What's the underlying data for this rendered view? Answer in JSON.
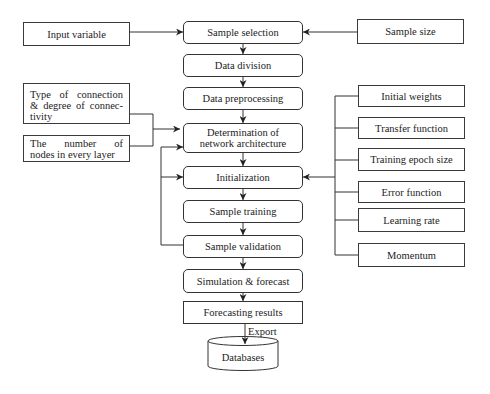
{
  "diagram": {
    "main_flow": [
      {
        "label": "Sample selection"
      },
      {
        "label": "Data division"
      },
      {
        "label": "Data preprocessing"
      },
      {
        "lines": [
          "Determination of",
          "network architecture"
        ]
      },
      {
        "label": "Initialization"
      },
      {
        "label": "Sample training"
      },
      {
        "label": "Sample validation"
      },
      {
        "label": "Simulation & forecast"
      },
      {
        "label": "Forecasting results"
      }
    ],
    "left_inputs": [
      {
        "label": "Input variable"
      },
      {
        "lines": [
          "Type of connection",
          "& degree of connec-",
          "tivity"
        ]
      },
      {
        "lines": [
          "The number of",
          "nodes in every layer"
        ]
      }
    ],
    "right_inputs": {
      "sample_size": "Sample size"
    },
    "training_parameters": [
      "Initial weights",
      "Transfer function",
      "Training epoch size",
      "Error function",
      "Learning rate",
      "Momentum"
    ],
    "export_label": "Export",
    "output_store": {
      "label": "Databases",
      "shape": "cylinder"
    },
    "edges": [
      {
        "from": "Input variable",
        "to": "Sample selection"
      },
      {
        "from": "Sample size",
        "to": "Sample selection"
      },
      {
        "from": "Sample selection",
        "to": "Data division"
      },
      {
        "from": "Data division",
        "to": "Data preprocessing"
      },
      {
        "from": "Data preprocessing",
        "to": "Determination of network architecture"
      },
      {
        "from": "Type of connection & degree of connectivity",
        "to": "Determination of network architecture"
      },
      {
        "from": "The number of nodes in every layer",
        "to": "Determination of network architecture"
      },
      {
        "from": "Determination of network architecture",
        "to": "Initialization"
      },
      {
        "from": "Training parameters",
        "to": "Initialization"
      },
      {
        "from": "Initialization",
        "to": "Sample training"
      },
      {
        "from": "Sample training",
        "to": "Sample validation"
      },
      {
        "from": "Sample validation",
        "to": "Determination of network architecture"
      },
      {
        "from": "Sample validation",
        "to": "Initialization"
      },
      {
        "from": "Sample validation",
        "to": "Simulation & forecast"
      },
      {
        "from": "Simulation & forecast",
        "to": "Forecasting results"
      },
      {
        "from": "Forecasting results",
        "to": "Databases",
        "label": "Export"
      }
    ],
    "colors": {
      "line": "#333333",
      "text": "#1c1c1c",
      "background": "#ffffff"
    }
  }
}
